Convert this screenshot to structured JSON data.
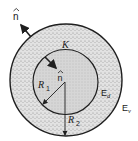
{
  "diagram": {
    "type": "concentric-spheres",
    "colors": {
      "background": "#ffffff",
      "stroke": "#1f1f1f",
      "shell_fill": "#d4d4d4",
      "core_fill": "#cacaca"
    },
    "outer_circle": {
      "cx": 66,
      "cy": 80,
      "r": 56
    },
    "inner_circle": {
      "cx": 65.5,
      "cy": 82,
      "r": 32.5
    },
    "labels": {
      "outer_normal": "n",
      "inner_normal": "n",
      "dielectric_constant": "K",
      "radius_inner": "R",
      "radius_inner_sub": "1",
      "radius_outer": "R",
      "radius_outer_sub": "2",
      "field_dielectric": "E",
      "field_dielectric_sub": "d",
      "field_vacuum": "E",
      "field_vacuum_sub": "v"
    }
  }
}
